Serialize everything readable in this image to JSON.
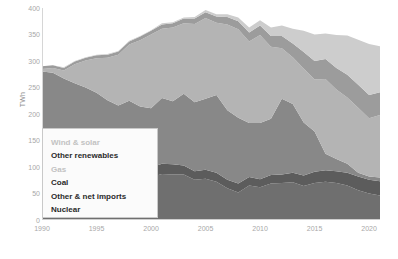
{
  "chart_data": {
    "type": "area",
    "title": "",
    "subtitle": "",
    "xlabel": "",
    "ylabel": "TWh",
    "stacked": true,
    "grid": false,
    "legend_position": "lower-left-inside",
    "xlim": [
      1990,
      2021
    ],
    "ylim": [
      0,
      400
    ],
    "ytick_labels": [
      "400",
      "350",
      "300",
      "250",
      "200",
      "150",
      "100",
      "50",
      "0"
    ],
    "ytick_values": [
      400,
      350,
      300,
      250,
      200,
      150,
      100,
      50,
      0
    ],
    "xtick_labels": [
      "1990",
      "1995",
      "2000",
      "2005",
      "2010",
      "2015",
      "2020"
    ],
    "xtick_values": [
      1990,
      1995,
      2000,
      2005,
      2010,
      2015,
      2020
    ],
    "x": [
      1990,
      1991,
      1992,
      1993,
      1994,
      1995,
      1996,
      1997,
      1998,
      1999,
      2000,
      2001,
      2002,
      2003,
      2004,
      2005,
      2006,
      2007,
      2008,
      2009,
      2010,
      2011,
      2012,
      2013,
      2014,
      2015,
      2016,
      2017,
      2018,
      2019,
      2020,
      2021
    ],
    "series": [
      {
        "name": "Nuclear",
        "color": "#6f6f6f",
        "values": [
          59,
          65,
          71,
          83,
          83,
          84,
          90,
          92,
          94,
          93,
          81,
          87,
          86,
          86,
          76,
          78,
          72,
          60,
          52,
          65,
          62,
          69,
          70,
          71,
          64,
          70,
          72,
          70,
          65,
          56,
          50,
          46
        ]
      },
      {
        "name": "Other & net imports",
        "color": "#5c5c5c",
        "values": [
          13,
          13,
          13,
          14,
          15,
          16,
          16,
          17,
          17,
          17,
          18,
          19,
          19,
          17,
          16,
          17,
          17,
          16,
          17,
          16,
          15,
          16,
          16,
          18,
          20,
          21,
          22,
          22,
          24,
          26,
          26,
          27
        ]
      },
      {
        "name": "Coal",
        "color": "#888888",
        "values": [
          208,
          200,
          183,
          161,
          152,
          140,
          120,
          107,
          114,
          104,
          112,
          124,
          119,
          135,
          130,
          134,
          147,
          131,
          124,
          102,
          106,
          106,
          143,
          130,
          100,
          76,
          31,
          23,
          17,
          7,
          6,
          7
        ]
      },
      {
        "name": "Gas",
        "color": "#b4b4b4",
        "values": [
          5,
          9,
          15,
          36,
          51,
          65,
          80,
          96,
          106,
          125,
          139,
          131,
          139,
          133,
          148,
          152,
          136,
          162,
          167,
          154,
          166,
          136,
          95,
          88,
          102,
          98,
          141,
          131,
          125,
          123,
          110,
          118
        ]
      },
      {
        "name": "Other renewables",
        "color": "#9c9c9c",
        "values": [
          5,
          5,
          5,
          5,
          5,
          6,
          6,
          6,
          6,
          7,
          7,
          8,
          8,
          9,
          10,
          11,
          12,
          14,
          15,
          17,
          18,
          20,
          23,
          26,
          31,
          35,
          38,
          41,
          43,
          43,
          44,
          43
        ]
      },
      {
        "name": "Wind & solar",
        "color": "#cdcdcd",
        "values": [
          0,
          0,
          1,
          1,
          1,
          1,
          1,
          1,
          1,
          1,
          1,
          2,
          2,
          2,
          3,
          4,
          4,
          5,
          7,
          9,
          10,
          16,
          20,
          28,
          40,
          50,
          48,
          62,
          74,
          85,
          96,
          87
        ]
      }
    ]
  },
  "axis": {
    "y_title": "TWh"
  },
  "legend": {
    "items": [
      {
        "label": "Wind & solar",
        "key": "wind-solar",
        "faint": true
      },
      {
        "label": "Other renewables",
        "key": "other-renewables",
        "faint": false
      },
      {
        "label": "Gas",
        "key": "gas",
        "faint": true
      },
      {
        "label": "Coal",
        "key": "coal",
        "faint": false
      },
      {
        "label": "Other & net imports",
        "key": "other-net-imports",
        "faint": false
      },
      {
        "label": "Nuclear",
        "key": "nuclear",
        "faint": false
      }
    ]
  },
  "watermark": {
    "text": ""
  }
}
